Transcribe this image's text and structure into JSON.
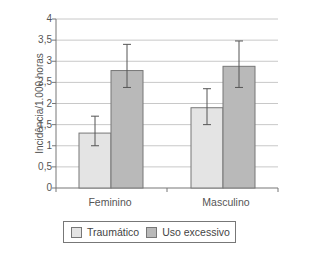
{
  "chart_data": {
    "type": "bar",
    "title": "",
    "xlabel": "",
    "ylabel": "Incidência/1.000 horas",
    "ylim": [
      0,
      4
    ],
    "yticks": [
      "0",
      "0,5",
      "1",
      "1,5",
      "2",
      "2,5",
      "3",
      "3,5",
      "4"
    ],
    "grid": true,
    "legend_position": "bottom",
    "categories": [
      "Feminino",
      "Masculino"
    ],
    "series": [
      {
        "name": "Traumático",
        "color": "#e4e4e4",
        "values": [
          1.3,
          1.9
        ],
        "error_low": [
          1.0,
          1.5
        ],
        "error_high": [
          1.7,
          2.35
        ]
      },
      {
        "name": "Uso excessivo",
        "color": "#b9b9b9",
        "values": [
          2.78,
          2.88
        ],
        "error_low": [
          2.38,
          2.38
        ],
        "error_high": [
          3.4,
          3.48
        ]
      }
    ]
  }
}
